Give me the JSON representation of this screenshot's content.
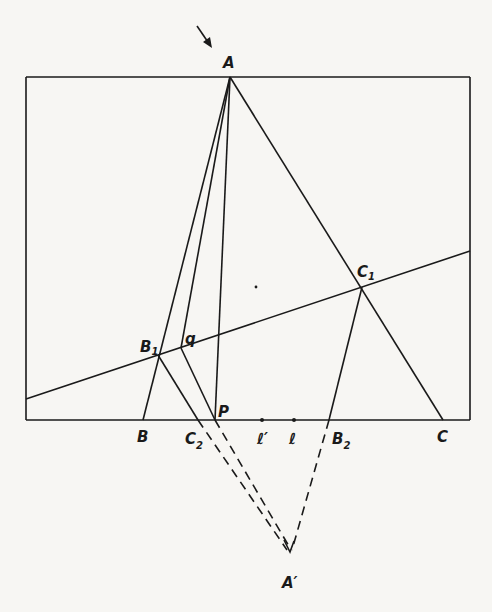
{
  "figure": {
    "background": "#f7f6f3",
    "ink": "#1a1a1a",
    "points": {
      "A": {
        "label": "A",
        "sub": ""
      },
      "B": {
        "label": "B",
        "sub": ""
      },
      "C": {
        "label": "C",
        "sub": ""
      },
      "B1": {
        "label": "B",
        "sub": "1"
      },
      "C1": {
        "label": "C",
        "sub": "1"
      },
      "C2": {
        "label": "C",
        "sub": "2"
      },
      "B2": {
        "label": "B",
        "sub": "2"
      },
      "P": {
        "label": "P",
        "sub": ""
      },
      "q": {
        "label": "q",
        "sub": ""
      },
      "l": {
        "label": "ℓ",
        "sub": ""
      },
      "lp": {
        "label": "ℓ′",
        "sub": ""
      },
      "Ap": {
        "label": "A′",
        "sub": ""
      }
    },
    "annotations": {
      "arrow": "pointer-arrow toward A"
    }
  }
}
